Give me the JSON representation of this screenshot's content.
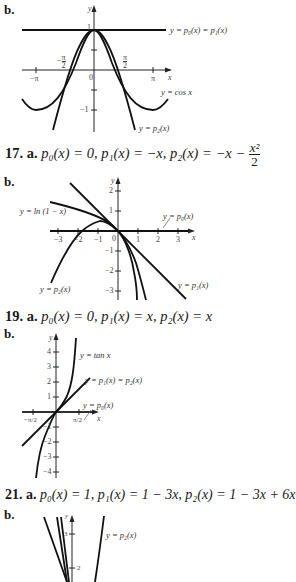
{
  "graphs": [
    {
      "part_label": "b.",
      "annotations": {
        "p0p1": "y = p₀(x) = p₁(x)",
        "cos": "y = cos x",
        "p2": "y = p₂(x)"
      },
      "ticks": {
        "y_label": "y",
        "x_label": "x",
        "y_one": "1",
        "y_neg_one": "−1",
        "neg_pi": "−π",
        "pi": "π",
        "zero": "0",
        "neg_pi_half_num": "π",
        "neg_pi_half_den": "2",
        "pi_half_num": "π",
        "pi_half_den": "2"
      }
    },
    {
      "problem_number": "17.",
      "part_a": "a.",
      "formula": "p₀(x) = 0, p₁(x) = −x, p₂(x) = −x −",
      "frac_num": "x²",
      "frac_den": "2",
      "part_label": "b.",
      "annotations": {
        "ln": "y = ln (1 − x)",
        "p0": "y = p₀(x)",
        "p1": "y = p₁(x)",
        "p2": "y = p₂(x)"
      },
      "ticks": {
        "y_label": "y",
        "x_label": "x",
        "x": [
          "−3",
          "−2",
          "−1",
          "0",
          "1",
          "2",
          "3"
        ],
        "y": [
          "2",
          "1",
          "−1",
          "−2",
          "−3"
        ]
      }
    },
    {
      "problem_number": "19.",
      "part_a": "a.",
      "formula": "p₀(x) = 0, p₁(x) = x, p₂(x) = x",
      "part_label": "b.",
      "annotations": {
        "tan": "y = tan x",
        "p1p2": "y = p₁(x) = p₂(x)",
        "p0": "y = p₀(x)"
      },
      "ticks": {
        "y_label": "y",
        "x_label": "x",
        "y": [
          "4",
          "3",
          "2",
          "1",
          "−1",
          "−2",
          "−3",
          "−4"
        ],
        "neg_pi_half": "−π/2",
        "pi_half": "π/2"
      }
    },
    {
      "problem_number": "21.",
      "part_a": "a.",
      "formula": "p₀(x) = 1, p₁(x) = 1 − 3x, p₂(x) = 1 − 3x + 6x²",
      "part_label": "b.",
      "annotations": {
        "p2": "y = p₂(x)"
      },
      "ticks": {
        "y_label": "y",
        "y": [
          "3",
          "2"
        ]
      }
    }
  ]
}
